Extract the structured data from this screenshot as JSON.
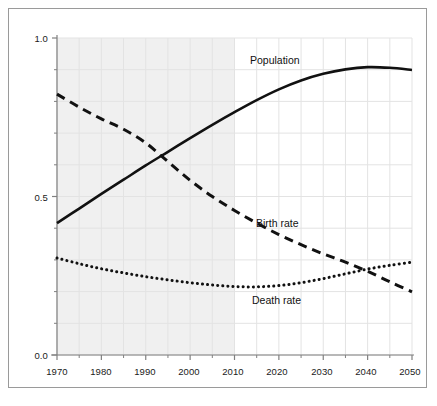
{
  "chart_data": {
    "type": "line",
    "title": "",
    "subtitle": "",
    "xlabel": "",
    "ylabel": "",
    "xlim": [
      1970,
      2050
    ],
    "ylim": [
      0.0,
      1.0
    ],
    "grid": true,
    "legend_position": "inline-annotations",
    "x_ticks": [
      "1970",
      "1980",
      "1990",
      "2000",
      "2010",
      "2020",
      "2030",
      "2040",
      "2050"
    ],
    "x_tick_values": [
      1970,
      1980,
      1990,
      2000,
      2010,
      2020,
      2030,
      2040,
      2050
    ],
    "x_minor_tick_values": [
      1975,
      1985,
      1995,
      2005,
      2015,
      2025,
      2035,
      2045
    ],
    "y_ticks": [
      "0.0",
      "0.5",
      "1.0"
    ],
    "y_tick_values": [
      0.0,
      0.5,
      1.0
    ],
    "y_minor_tick_values": [
      0.1,
      0.2,
      0.3,
      0.4,
      0.6,
      0.7,
      0.8,
      0.9
    ],
    "shaded_region": {
      "name": "historical-period",
      "x_start": 1970,
      "x_end": 2010,
      "color": "#f0f0f0"
    },
    "x": [
      1970,
      1975,
      1980,
      1985,
      1990,
      1995,
      2000,
      2005,
      2010,
      2015,
      2020,
      2025,
      2030,
      2035,
      2040,
      2045,
      2050
    ],
    "series": [
      {
        "name": "Population",
        "label": "Population",
        "style": "solid",
        "color": "#111111",
        "values": [
          0.416,
          0.462,
          0.508,
          0.553,
          0.598,
          0.641,
          0.684,
          0.726,
          0.766,
          0.804,
          0.838,
          0.866,
          0.887,
          0.901,
          0.908,
          0.906,
          0.899
        ]
      },
      {
        "name": "Birth rate",
        "label": "Birth rate",
        "style": "dashed",
        "color": "#111111",
        "values": [
          0.823,
          0.782,
          0.745,
          0.712,
          0.669,
          0.61,
          0.551,
          0.5,
          0.456,
          0.416,
          0.38,
          0.348,
          0.319,
          0.293,
          0.264,
          0.231,
          0.199
        ]
      },
      {
        "name": "Death rate",
        "label": "Death rate",
        "style": "dotted",
        "color": "#111111",
        "values": [
          0.306,
          0.288,
          0.272,
          0.259,
          0.247,
          0.237,
          0.228,
          0.221,
          0.216,
          0.215,
          0.219,
          0.228,
          0.241,
          0.256,
          0.271,
          0.283,
          0.293
        ]
      }
    ],
    "annotations": [
      {
        "text": "Population",
        "x": 2023,
        "y": 0.945
      },
      {
        "text": "Birth rate",
        "x": 2023,
        "y": 0.425
      },
      {
        "text": "Death rate",
        "x": 2022,
        "y": 0.183
      }
    ]
  },
  "axes": {
    "y_labels": [
      {
        "id": "y-1-0",
        "text": "1.0"
      },
      {
        "id": "y-0-5",
        "text": "0.5"
      },
      {
        "id": "y-0-0",
        "text": "0.0"
      }
    ],
    "x_labels": [
      {
        "id": "x-1970",
        "text": "1970"
      },
      {
        "id": "x-1980",
        "text": "1980"
      },
      {
        "id": "x-1990",
        "text": "1990"
      },
      {
        "id": "x-2000",
        "text": "2000"
      },
      {
        "id": "x-2010",
        "text": "2010"
      },
      {
        "id": "x-2020",
        "text": "2020"
      },
      {
        "id": "x-2030",
        "text": "2030"
      },
      {
        "id": "x-2040",
        "text": "2040"
      },
      {
        "id": "x-2050",
        "text": "2050"
      }
    ]
  },
  "colors": {
    "line": "#111111",
    "axis": "#808080",
    "grid": "#e3e3e3",
    "shade": "#f0f0f0",
    "frame": "#9a9a9a",
    "background": "#ffffff",
    "text": "#1a1a1a"
  }
}
